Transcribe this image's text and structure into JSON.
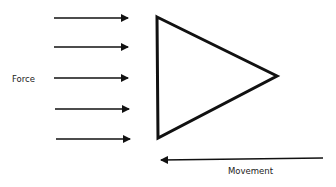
{
  "diagram": {
    "labels": {
      "force": "Force",
      "movement": "Movement"
    },
    "colors": {
      "stroke": "#111111",
      "background": "#ffffff",
      "text": "#222222"
    },
    "force_arrows": [
      {
        "x1": 54,
        "x2": 128,
        "y": 18
      },
      {
        "x1": 54,
        "x2": 128,
        "y": 47
      },
      {
        "x1": 54,
        "x2": 128,
        "y": 78
      },
      {
        "x1": 55,
        "x2": 129,
        "y": 109
      },
      {
        "x1": 56,
        "x2": 130,
        "y": 139
      }
    ],
    "triangle": {
      "points": [
        [
          157,
          17
        ],
        [
          277,
          76
        ],
        [
          158,
          138
        ]
      ]
    },
    "movement_arrow": {
      "x1": 323,
      "y1": 158,
      "x2": 161,
      "y2": 160
    }
  }
}
